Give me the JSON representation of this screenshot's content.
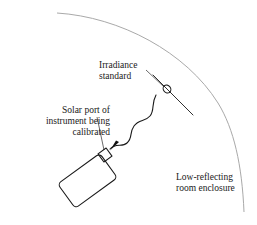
{
  "figure": {
    "background_color": "#ffffff",
    "width": 257,
    "height": 225
  },
  "colors": {
    "ink": "#1a1a1a",
    "leader": "#2b2b2b",
    "arc": "#a9a9a9",
    "arrow_fill": "#111111",
    "background": "#ffffff"
  },
  "labels": {
    "irradiance_standard": {
      "line1": "Irradiance",
      "line2": "standard",
      "x": 99,
      "y": 68,
      "align": "start"
    },
    "solar_port": {
      "line1": "Solar port of",
      "line2": "instrument being",
      "line3": "calibrated",
      "x": 110,
      "y": 113,
      "align": "end"
    },
    "room_enclosure": {
      "line1": "Low-reflecting",
      "line2": "room enclosure",
      "x": 176,
      "y": 180,
      "align": "start"
    }
  },
  "geometry": {
    "enclosure_arc": {
      "path": "M 57 13 C 120 17 186 52 218 103 C 234 129 242 165 244 212",
      "stroke_width": 1,
      "description": "quarter-arc wall of low-reflecting room enclosure"
    },
    "lamp": {
      "center_x": 167,
      "center_y": 89,
      "radius_x": 3.6,
      "radius_y": 4.2,
      "rotation": -38,
      "support_line": "M 153 75 L 193 115",
      "description": "irradiance standard lamp symbol"
    },
    "leader_irradiance": {
      "path": "M 146 70 L 163 86"
    },
    "leader_solar_port": {
      "path": "M 97 117 L 104 150"
    },
    "beam": {
      "path": "M 156 95 C 151 104 155 110 150 116 C 145 122 139 119 134 126 C 129 133 133 138 127 143 C 122 148 116 142 110 149",
      "stroke_width": 1.1,
      "description": "wavy radiation beam from standard to solar port"
    },
    "beam_arrow": {
      "points": "110,150.5 119,142 116,140.5 113,145.5",
      "description": "arrowhead at solar port end of beam"
    },
    "instrument_body": {
      "x": -26,
      "y": -9,
      "width": 52,
      "height": 30,
      "rx": 4,
      "center_x": 84,
      "center_y": 176,
      "rotation": -36,
      "stroke_width": 1.1,
      "description": "instrument being calibrated, tilted housing"
    },
    "solar_port_square": {
      "x": -5,
      "y": -5,
      "width": 10,
      "height": 10,
      "center_x": 105,
      "center_y": 155,
      "rotation": -36,
      "stroke_width": 1.1,
      "description": "small square solar aperture port on instrument"
    }
  },
  "icons": {
    "lamp": "lamp-icon",
    "arrow": "arrow-head-icon",
    "wave": "wave-beam-icon"
  }
}
